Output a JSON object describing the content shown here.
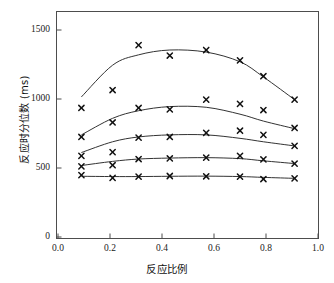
{
  "chart_data": {
    "type": "scatter",
    "title": "",
    "xlabel": "反应比例",
    "ylabel": "反应时分位数 (ms)",
    "xlim": [
      0.0,
      1.0
    ],
    "ylim": [
      0,
      1650
    ],
    "grid": false,
    "legend": "none",
    "marker": "x",
    "xticks": [
      "0.0",
      "0.2",
      "0.4",
      "0.6",
      "0.8",
      "1.0"
    ],
    "xtick_values": [
      0.0,
      0.2,
      0.4,
      0.6,
      0.8,
      1.0
    ],
    "yticks": [
      "0",
      "500",
      "1000",
      "1500"
    ],
    "ytick_values": [
      0,
      500,
      1000,
      1500
    ],
    "x": [
      0.09,
      0.21,
      0.31,
      0.43,
      0.57,
      0.7,
      0.79,
      0.91
    ],
    "series": [
      {
        "name": "quantile-5",
        "values": [
          935,
          1065,
          1390,
          1315,
          1355,
          1280,
          1165,
          995
        ],
        "fit": [
          1015,
          1245,
          1320,
          1355,
          1340,
          1270,
          1160,
          995
        ]
      },
      {
        "name": "quantile-4",
        "values": [
          725,
          830,
          935,
          925,
          995,
          965,
          920,
          790
        ],
        "fit": [
          740,
          860,
          915,
          945,
          940,
          890,
          840,
          785
        ]
      },
      {
        "name": "quantile-3",
        "values": [
          588,
          615,
          720,
          725,
          755,
          770,
          740,
          660
        ],
        "fit": [
          612,
          690,
          725,
          740,
          740,
          715,
          690,
          660
        ]
      },
      {
        "name": "quantile-2",
        "values": [
          512,
          520,
          565,
          570,
          575,
          588,
          562,
          532
        ],
        "fit": [
          518,
          548,
          565,
          572,
          575,
          568,
          552,
          532
        ]
      },
      {
        "name": "quantile-1",
        "values": [
          448,
          428,
          438,
          442,
          440,
          438,
          420,
          425
        ],
        "fit": [
          440,
          438,
          438,
          440,
          441,
          438,
          432,
          425
        ]
      }
    ]
  },
  "axes": {
    "frame_color": "#4d4d4d",
    "line_color": "#333333",
    "marker_color": "#111111"
  }
}
